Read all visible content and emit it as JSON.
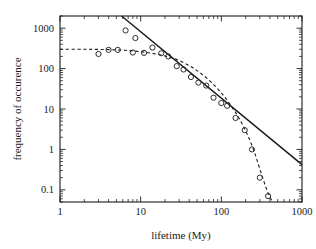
{
  "chart_data": {
    "type": "scatter",
    "title": "",
    "subtitle": "",
    "xlabel": "lifetime (My)",
    "ylabel": "frequency of occurence",
    "xscale": "log",
    "yscale": "log",
    "xlim": [
      1,
      1000
    ],
    "ylim": [
      0.05,
      2000
    ],
    "grid": false,
    "legend": "none",
    "xticks": [
      1,
      10,
      100,
      1000
    ],
    "xtick_labels": [
      "1",
      "10",
      "100",
      "1000"
    ],
    "yticks": [
      0.1,
      1,
      10,
      100,
      1000
    ],
    "ytick_labels": [
      "0.1",
      "1",
      "10",
      "100",
      "1000"
    ],
    "series": [
      {
        "name": "observed frequency",
        "type": "scatter",
        "marker": "open-circle",
        "x": [
          3.0,
          4.0,
          5.2,
          6.5,
          8.0,
          8.6,
          11.0,
          14.0,
          18.0,
          22.0,
          28.0,
          34.0,
          42.0,
          52.0,
          65.0,
          80.0,
          100.0,
          118.0,
          150.0,
          195.0,
          240.0,
          300.0,
          380.0
        ],
        "y": [
          230,
          290,
          290,
          880,
          250,
          570,
          245,
          330,
          240,
          200,
          115,
          95,
          62,
          45,
          38,
          19,
          14,
          12,
          6.0,
          3.0,
          1.0,
          0.2,
          0.07
        ]
      },
      {
        "name": "power-law fit",
        "type": "line",
        "style": "solid",
        "x": [
          5.8,
          1000
        ],
        "y": [
          2000,
          0.42
        ]
      },
      {
        "name": "exponential-cutoff fit",
        "type": "line",
        "style": "dashed",
        "x": [
          1.0,
          2.0,
          3.0,
          4.0,
          5.0,
          7.0,
          10.0,
          14.0,
          20.0,
          28.0,
          40.0,
          55.0,
          75.0,
          100.0,
          130.0,
          165.0,
          205.0,
          250.0,
          300.0,
          360.0,
          420.0
        ],
        "y": [
          300,
          300,
          298,
          295,
          290,
          280,
          262,
          238,
          205,
          168,
          118,
          78,
          46,
          25,
          12.5,
          6.0,
          2.6,
          1.0,
          0.33,
          0.11,
          0.055
        ]
      }
    ]
  },
  "axes": {
    "x_axis_name": "lifetime-axis",
    "y_axis_name": "frequency-axis"
  }
}
